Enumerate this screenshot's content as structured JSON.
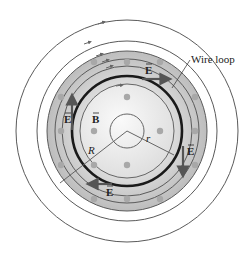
{
  "diagram": {
    "labels": {
      "wire_loop": "Wire loop",
      "e_top": "E",
      "e_left": "E",
      "e_right": "E",
      "e_bottom": "E",
      "b_field": "B",
      "radius_big": "R",
      "radius_small": "r"
    },
    "colors": {
      "line": "#5a5a5a",
      "wire": "#1a1a1a",
      "shade_outer": "#bdbdbd",
      "shade_inner": "#f2f2f2",
      "dot": "#a8a8a8",
      "arrow": "#555555"
    },
    "field_lines": {
      "count": 6,
      "direction": "clockwise"
    },
    "b_field_direction": "out of page (dots)"
  }
}
